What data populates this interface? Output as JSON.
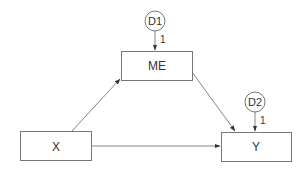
{
  "diagram": {
    "type": "path-diagram",
    "nodes": {
      "x": {
        "label": "X",
        "shape": "rectangle"
      },
      "me": {
        "label": "ME",
        "shape": "rectangle"
      },
      "y": {
        "label": "Y",
        "shape": "rectangle"
      },
      "d1": {
        "label": "D1",
        "shape": "circle"
      },
      "d2": {
        "label": "D2",
        "shape": "circle"
      }
    },
    "edges": [
      {
        "from": "X",
        "to": "ME",
        "label": ""
      },
      {
        "from": "ME",
        "to": "Y",
        "label": ""
      },
      {
        "from": "X",
        "to": "Y",
        "label": ""
      },
      {
        "from": "D1",
        "to": "ME",
        "label": "1"
      },
      {
        "from": "D2",
        "to": "Y",
        "label": "1"
      }
    ],
    "colors": {
      "stroke": "#555555",
      "text": "#333333",
      "background": "#ffffff"
    }
  }
}
